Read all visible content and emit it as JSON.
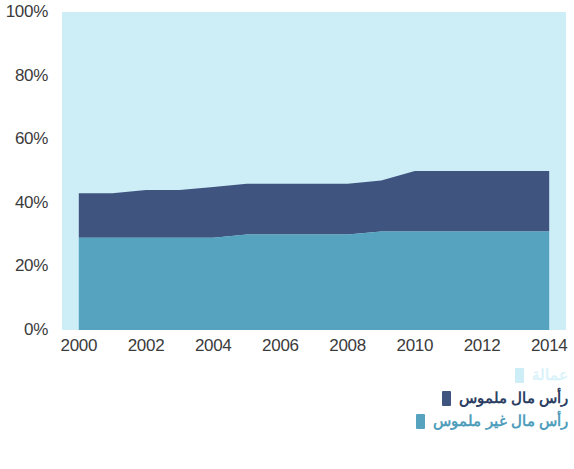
{
  "chart_data": {
    "type": "area",
    "stacked": true,
    "normalized": true,
    "title": "",
    "xlabel": "",
    "ylabel": "",
    "x": [
      2000,
      2001,
      2002,
      2003,
      2004,
      2005,
      2006,
      2007,
      2008,
      2009,
      2010,
      2011,
      2012,
      2013,
      2014
    ],
    "xlim": [
      1999.5,
      2014.5
    ],
    "ylim": [
      0,
      100
    ],
    "y_ticks": [
      "0%",
      "20%",
      "40%",
      "60%",
      "80%",
      "100%"
    ],
    "y_tick_values": [
      0,
      20,
      40,
      60,
      80,
      100
    ],
    "x_ticks": [
      "2000",
      "2002",
      "2004",
      "2006",
      "2008",
      "2010",
      "2012",
      "2014"
    ],
    "x_tick_values": [
      2000,
      2002,
      2004,
      2006,
      2008,
      2010,
      2012,
      2014
    ],
    "grid": false,
    "legend_position": "bottom-right",
    "series": [
      {
        "name": "عمالة",
        "color": "#cdeef7",
        "stack_order": 3,
        "values": [
          57,
          57,
          56,
          56,
          55,
          54,
          54,
          54,
          54,
          53,
          50,
          50,
          50,
          50,
          50
        ]
      },
      {
        "name": "رأس مال ملموس",
        "color": "#3f5580",
        "stack_order": 2,
        "values": [
          14,
          14,
          15,
          15,
          16,
          16,
          16,
          16,
          16,
          16,
          19,
          19,
          19,
          19,
          19
        ]
      },
      {
        "name": "رأس مال غير ملموس",
        "color": "#56a3bf",
        "stack_order": 1,
        "values": [
          29,
          29,
          29,
          29,
          29,
          30,
          30,
          30,
          30,
          31,
          31,
          31,
          31,
          31,
          31
        ]
      }
    ],
    "boundaries": {
      "lower_band_top": [
        29,
        29,
        29,
        29,
        29,
        30,
        30,
        30,
        30,
        31,
        31,
        31,
        31,
        31,
        31
      ],
      "middle_band_top": [
        43,
        43,
        44,
        44,
        45,
        46,
        46,
        46,
        46,
        47,
        50,
        50,
        50,
        50,
        50
      ]
    }
  },
  "legend": {
    "items": [
      {
        "label": "عمالة",
        "color": "#cdeef7",
        "text_color": "#daf3fa"
      },
      {
        "label": "رأس مال ملموس",
        "color": "#3f5580",
        "text_color": "#2d3f63"
      },
      {
        "label": "رأس مال غير ملموس",
        "color": "#56a3bf",
        "text_color": "#4f9ebb"
      }
    ]
  },
  "colors": {
    "light_cyan": "#cdeef7",
    "navy": "#3f5580",
    "teal": "#56a3bf",
    "axis_text": "#3b3b3b",
    "background": "#ffffff"
  }
}
